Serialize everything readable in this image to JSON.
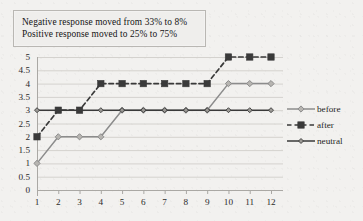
{
  "annotation": {
    "lines": [
      "Negative response moved from 33% to 8%",
      "Positive response moved to 25% to 75%"
    ]
  },
  "legend": {
    "position": "right",
    "entries": [
      {
        "label": "before",
        "color": "#8c8c8c",
        "dash": "solid",
        "marker": "diamond"
      },
      {
        "label": "after",
        "color": "#3a3a3a",
        "dash": "dashed",
        "marker": "square"
      },
      {
        "label": "neutral",
        "color": "#3a3a3a",
        "dash": "solid",
        "marker": "diamond-small"
      }
    ]
  },
  "axes": {
    "y_ticks": [
      "5",
      "4.5",
      "4",
      "3.5",
      "3",
      "2.5",
      "2",
      "1.5",
      "1",
      "0.5",
      "0"
    ],
    "x_ticks": [
      "1",
      "2",
      "3",
      "4",
      "5",
      "6",
      "7",
      "8",
      "9",
      "10",
      "11",
      "12"
    ]
  },
  "colors": {
    "background": "#f2f1ef",
    "gridline": "#d4d2ce",
    "axis": "#aaa8a4",
    "before": "#8c8c8c",
    "after": "#3a3a3a",
    "neutral": "#3a3a3a"
  },
  "chart_data": {
    "type": "line",
    "title": "",
    "xlabel": "",
    "ylabel": "",
    "x": [
      1,
      2,
      3,
      4,
      5,
      6,
      7,
      8,
      9,
      10,
      11,
      12
    ],
    "xlim": [
      1,
      12
    ],
    "ylim": [
      0,
      5
    ],
    "ytick_step": 0.5,
    "grid": true,
    "legend_position": "right",
    "annotations": [
      "Negative response moved from 33% to 8%",
      "Positive response moved to 25% to 75%"
    ],
    "series": [
      {
        "name": "before",
        "values": [
          1,
          2,
          2,
          2,
          3,
          3,
          3,
          3,
          3,
          4,
          4,
          4
        ],
        "color": "#8c8c8c",
        "style": "solid",
        "marker": "diamond"
      },
      {
        "name": "after",
        "values": [
          2,
          3,
          3,
          4,
          4,
          4,
          4,
          4,
          4,
          5,
          5,
          5
        ],
        "color": "#3a3a3a",
        "style": "dashed",
        "marker": "square"
      },
      {
        "name": "neutral",
        "values": [
          3,
          3,
          3,
          3,
          3,
          3,
          3,
          3,
          3,
          3,
          3,
          3
        ],
        "color": "#3a3a3a",
        "style": "solid",
        "marker": "diamond-small"
      }
    ]
  }
}
